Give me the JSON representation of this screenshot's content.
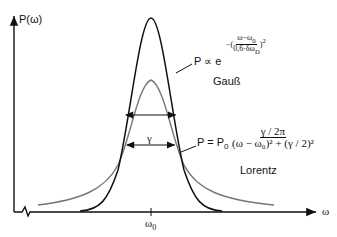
{
  "axes": {
    "y_label": "P(ω)",
    "x_label": "ω",
    "x_tick": "ω",
    "x_tick_sub": "0"
  },
  "gauss": {
    "formula_lhs": "P ∝ e",
    "exp_num": "ω−ω",
    "exp_num_sub": "0",
    "exp_den": "0,6·δω",
    "exp_den_sub": "D",
    "exp_power": "2",
    "name": "Gauß",
    "color": "#111111"
  },
  "lorentz": {
    "formula_lhs": "P = P",
    "lhs_sub": "0",
    "num": "γ / 2π",
    "den": "(ω − ω₀)² + (γ / 2)²",
    "name": "Lorentz",
    "color": "#777777"
  },
  "width_label": "γ"
}
